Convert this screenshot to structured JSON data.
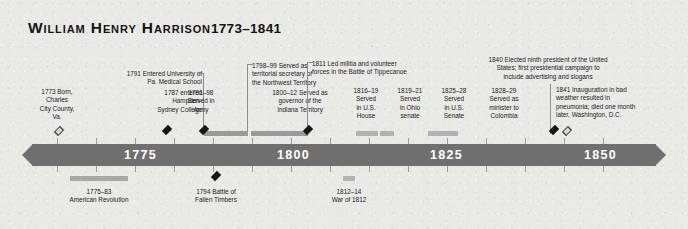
{
  "title": {
    "name": "William Henry Harrison",
    "years": "1773–1841"
  },
  "axis": {
    "ticks": [
      "1775",
      "1800",
      "1825",
      "1850"
    ],
    "start_year": 1770,
    "end_year": 1852,
    "labels": [
      {
        "text": "1775"
      },
      {
        "text": "1800"
      },
      {
        "text": "1825"
      },
      {
        "text": "1850"
      }
    ]
  },
  "events_above": [
    {
      "id": "born",
      "lines": [
        "1773 Born,",
        "Charles",
        "City County,",
        "Va."
      ],
      "marker": "light-diamond"
    },
    {
      "id": "hampden-sydney",
      "lines": [
        "1787 entered",
        "Hampden-",
        "Sydney College"
      ],
      "marker": "dark-diamond"
    },
    {
      "id": "penn-medical",
      "lines": [
        "1791 Entered University of",
        "Pa. Medical School"
      ],
      "marker": "dark-diamond"
    },
    {
      "id": "army",
      "lines": [
        "1791–98",
        "Served in",
        "Army"
      ],
      "marker": "bar"
    },
    {
      "id": "northwest-secretary",
      "lines": [
        "1798–99 Served as",
        "territorial secretary of",
        "the Northwest Territory"
      ],
      "marker": "bar"
    },
    {
      "id": "indiana-governor",
      "lines": [
        "1800–12 Served as",
        "governor of the",
        "Indiana Territory"
      ],
      "marker": "bar"
    },
    {
      "id": "tippecanoe",
      "lines": [
        "1811 Led militia and volunteer",
        "forces in the Battle of Tippecanoe"
      ],
      "marker": "dark-diamond"
    },
    {
      "id": "us-house",
      "lines": [
        "1816–19",
        "Served",
        "in U.S.",
        "House"
      ],
      "marker": "bar"
    },
    {
      "id": "ohio-senate",
      "lines": [
        "1819–21",
        "Served",
        "in Ohio",
        "senate"
      ],
      "marker": "bar"
    },
    {
      "id": "us-senate",
      "lines": [
        "1825–28",
        "Served",
        "in U.S.",
        "Senate"
      ],
      "marker": "bar"
    },
    {
      "id": "minister-colombia",
      "lines": [
        "1828–29",
        "Served as",
        "minister to",
        "Colombia"
      ],
      "marker": "bar"
    },
    {
      "id": "elected-president",
      "lines": [
        "1840 Elected ninth president of the United",
        "States; first presidential campaign to",
        "include advertising and slogans"
      ],
      "marker": "dark-diamond"
    },
    {
      "id": "death",
      "lines": [
        "1841 Inauguration in bad",
        "weather resulted in",
        "pneumonia; died one month",
        "later, Washington, D.C."
      ],
      "marker": "light-diamond"
    }
  ],
  "events_below": [
    {
      "id": "american-revolution",
      "lines": [
        "1775–83",
        "American Revolution"
      ],
      "marker": "bar"
    },
    {
      "id": "fallen-timbers",
      "lines": [
        "1794 Battle of",
        "Fallen Timbers"
      ],
      "marker": "dark-diamond"
    },
    {
      "id": "war-of-1812",
      "lines": [
        "1812–14",
        "War of 1812"
      ],
      "marker": "bar"
    }
  ],
  "colors": {
    "background": "#e9e9e6",
    "axis": "#6f6f6f",
    "bar_dark": "#9a9a9a",
    "bar_light": "#b9b9b9",
    "marker_dark": "#151515",
    "text": "#1b1b1b",
    "axis_label": "#ffffff"
  }
}
